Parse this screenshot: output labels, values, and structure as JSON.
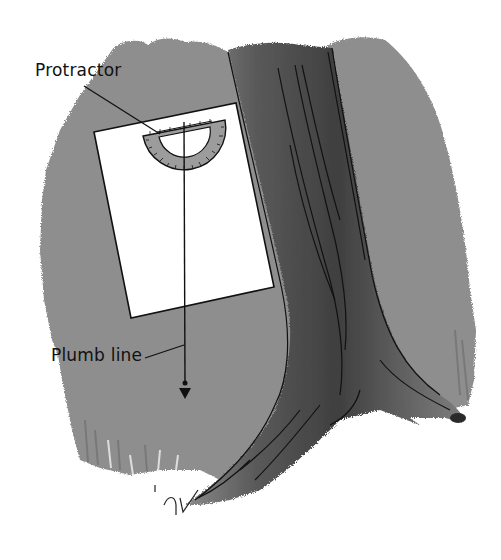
{
  "figure": {
    "labels": {
      "protractor": "Protractor",
      "plumb_line": "Plumb line"
    },
    "colors": {
      "background_wash": "#8e8e8e",
      "trunk_dark": "#4a4a4a",
      "trunk_mid": "#6e6e6e",
      "paper": "#ffffff",
      "ink": "#111111",
      "protractor_fill": "#9a9a9a"
    }
  }
}
